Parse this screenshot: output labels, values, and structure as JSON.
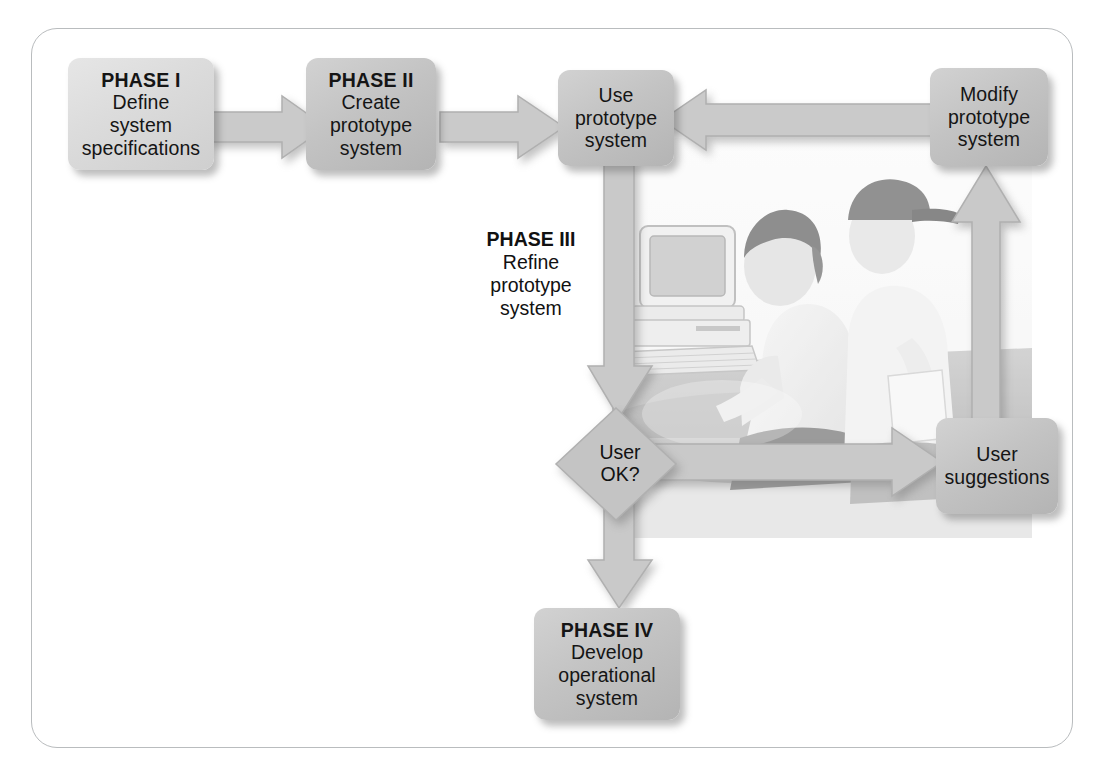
{
  "diagram": {
    "type": "flowchart",
    "frame_color": "#b9bcbe",
    "node_fill": "#c6c6c6",
    "arrow_fill": "#c8c8c8",
    "text_color": "#111111"
  },
  "nodes": {
    "phase1": {
      "heading": "PHASE I",
      "line1": "Define",
      "line2": "system",
      "line3": "specifications"
    },
    "phase2": {
      "heading": "PHASE II",
      "line1": "Create",
      "line2": "prototype",
      "line3": "system"
    },
    "use_prototype": {
      "line1": "Use",
      "line2": "prototype",
      "line3": "system"
    },
    "modify_prototype": {
      "line1": "Modify",
      "line2": "prototype",
      "line3": "system"
    },
    "phase3": {
      "heading": "PHASE III",
      "line1": "Refine",
      "line2": "prototype",
      "line3": "system"
    },
    "decision": {
      "line1": "User",
      "line2": "OK?"
    },
    "user_suggestions": {
      "line1": "User",
      "line2": "suggestions"
    },
    "phase4": {
      "heading": "PHASE IV",
      "line1": "Develop",
      "line2": "operational",
      "line3": "system"
    }
  },
  "arrows": [
    {
      "id": "phase1-to-phase2",
      "direction": "right",
      "from": "phase1",
      "to": "phase2"
    },
    {
      "id": "phase2-to-use",
      "direction": "right",
      "from": "phase2",
      "to": "use_prototype"
    },
    {
      "id": "modify-to-use",
      "direction": "left",
      "from": "modify_prototype",
      "to": "use_prototype"
    },
    {
      "id": "use-to-decision",
      "direction": "down",
      "from": "use_prototype",
      "to": "decision"
    },
    {
      "id": "decision-to-suggestions",
      "direction": "right",
      "from": "decision",
      "to": "user_suggestions"
    },
    {
      "id": "suggestions-to-modify",
      "direction": "up",
      "from": "user_suggestions",
      "to": "modify_prototype"
    },
    {
      "id": "decision-to-phase4",
      "direction": "down",
      "from": "decision",
      "to": "phase4"
    }
  ],
  "photo": {
    "caption": "Two people working together at a desktop computer",
    "elements": [
      "seated-user",
      "standing-user-with-cap",
      "crt-monitor",
      "keyboard",
      "desk"
    ]
  }
}
